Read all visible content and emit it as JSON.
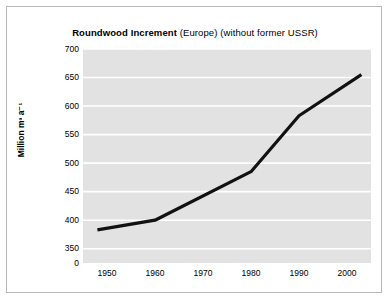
{
  "figure": {
    "title_bold": "Roundwood Increment",
    "title_rest": " (Europe) (without former USSR)",
    "ylabel": "Million m³ a⁻¹",
    "background_color": "#e2e2e2",
    "gridline_color": "#ffffff",
    "line_color": "#111111",
    "border_color": "#b7b7b7"
  },
  "chart_data": {
    "type": "line",
    "title": "Roundwood Increment (Europe) (without former USSR)",
    "xlabel": "",
    "ylabel": "Million m³ a⁻¹",
    "x": [
      1948,
      1960,
      1980,
      1990,
      2003
    ],
    "values": [
      383,
      400,
      485,
      583,
      655
    ],
    "series": [
      {
        "name": "Roundwood increment",
        "values": [
          383,
          400,
          485,
          583,
          655
        ]
      }
    ],
    "xlim": [
      1945,
      2005
    ],
    "ylim": [
      325,
      700
    ],
    "y_axis_broken": true,
    "xticks": [
      1950,
      1960,
      1970,
      1980,
      1990,
      2000
    ],
    "xtick_labels": [
      "1950",
      "1960",
      "1970",
      "1980",
      "1990",
      "2000"
    ],
    "yticks": [
      350,
      400,
      450,
      500,
      550,
      600,
      650,
      700
    ],
    "ytick_labels": [
      "0",
      "350",
      "400",
      "450",
      "500",
      "550",
      "600",
      "650",
      "700"
    ],
    "grid": true,
    "grid_axis": "y",
    "legend": null,
    "legend_position": "none"
  }
}
